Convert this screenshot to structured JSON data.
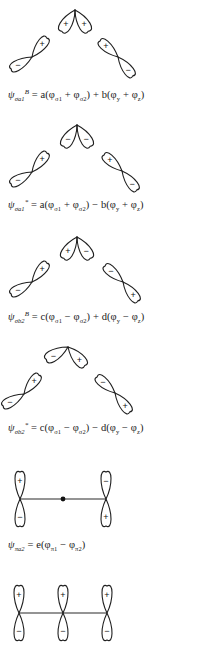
{
  "figure": {
    "colors": {
      "line": "#1f1f1f",
      "background": "#ffffff"
    },
    "diagrams": [
      {
        "id": "sigma-a1-bonding",
        "apex": [
          75,
          10
        ],
        "center_lobes": [
          {
            "angle": -145,
            "sign": "+"
          },
          {
            "angle": -35,
            "sign": "+"
          }
        ],
        "left_p": {
          "cross": [
            32,
            57
          ],
          "upper_sign": "+",
          "lower_sign": "−"
        },
        "right_p": {
          "cross": [
            118,
            57
          ],
          "upper_sign": "+",
          "lower_sign": "−"
        },
        "equation": {
          "psi": "ψ",
          "psi_sub": "σa₁",
          "psi_sup": "B",
          "rhs": "= a(φσ₁ + φσ₂) + b(φy + φz)"
        },
        "eq_top": 88
      },
      {
        "id": "sigma-a1-antibonding",
        "apex": [
          77,
          125
        ],
        "center_lobes": [
          {
            "angle": -145,
            "sign": "−"
          },
          {
            "angle": -35,
            "sign": "−"
          }
        ],
        "left_p": {
          "cross": [
            32,
            172
          ],
          "upper_sign": "+",
          "lower_sign": "−"
        },
        "right_p": {
          "cross": [
            122,
            171
          ],
          "upper_sign": "+",
          "lower_sign": "−"
        },
        "equation": {
          "psi": "ψ",
          "psi_sub": "σa₁",
          "psi_sup": "*",
          "rhs": "= a(φσ₁ + φσ₂) − b(φy + φz)"
        },
        "eq_top": 198
      },
      {
        "id": "sigma-b2-bonding",
        "apex": [
          77,
          237
        ],
        "center_lobes": [
          {
            "angle": -145,
            "sign": "+"
          },
          {
            "angle": -35,
            "sign": "−"
          }
        ],
        "left_p": {
          "cross": [
            32,
            282
          ],
          "upper_sign": "+",
          "lower_sign": "−"
        },
        "right_p": {
          "cross": [
            123,
            282
          ],
          "upper_sign": "−",
          "lower_sign": "+"
        },
        "equation": {
          "psi": "ψ",
          "psi_sub": "σb₂",
          "psi_sup": "B",
          "rhs": "= c(φσ₁ − φσ₂) + d(φy − φz)"
        },
        "eq_top": 310
      },
      {
        "id": "sigma-b2-antibonding",
        "apex": [
          68,
          347
        ],
        "center_lobes": [
          {
            "angle": -160,
            "sign": "−"
          },
          {
            "angle": -45,
            "sign": "+"
          }
        ],
        "left_p": {
          "cross": [
            24,
            394
          ],
          "upper_sign": "+",
          "lower_sign": "−"
        },
        "right_p": {
          "cross": [
            115,
            393
          ],
          "upper_sign": "−",
          "lower_sign": "+"
        },
        "equation": {
          "psi": "ψ",
          "psi_sub": "σb₂",
          "psi_sup": "*",
          "rhs": "= c(φσ1 − φσ2) − d(φy − φz)"
        },
        "eq_top": 421
      }
    ],
    "pi_diagrams": [
      {
        "id": "pi-a2",
        "y": 499,
        "orbitals": [
          {
            "x": 20,
            "upper_sign": "+",
            "lower_sign": "−"
          },
          {
            "x": 106,
            "upper_sign": "−",
            "lower_sign": "+"
          }
        ],
        "center_dot": [
          63,
          499
        ],
        "equation": {
          "psi": "ψ",
          "psi_sub": "πa₂",
          "psi_sup": "",
          "rhs": "= e(φπ1 − φπ2)"
        },
        "eq_top": 539
      },
      {
        "id": "pi-nonbonding",
        "y": 613,
        "orbitals": [
          {
            "x": 19,
            "upper_sign": "+",
            "lower_sign": "−"
          },
          {
            "x": 63,
            "upper_sign": "+",
            "lower_sign": "−"
          },
          {
            "x": 107,
            "upper_sign": "+",
            "lower_sign": "−"
          }
        ],
        "center_dot": null,
        "equation": null
      }
    ]
  }
}
